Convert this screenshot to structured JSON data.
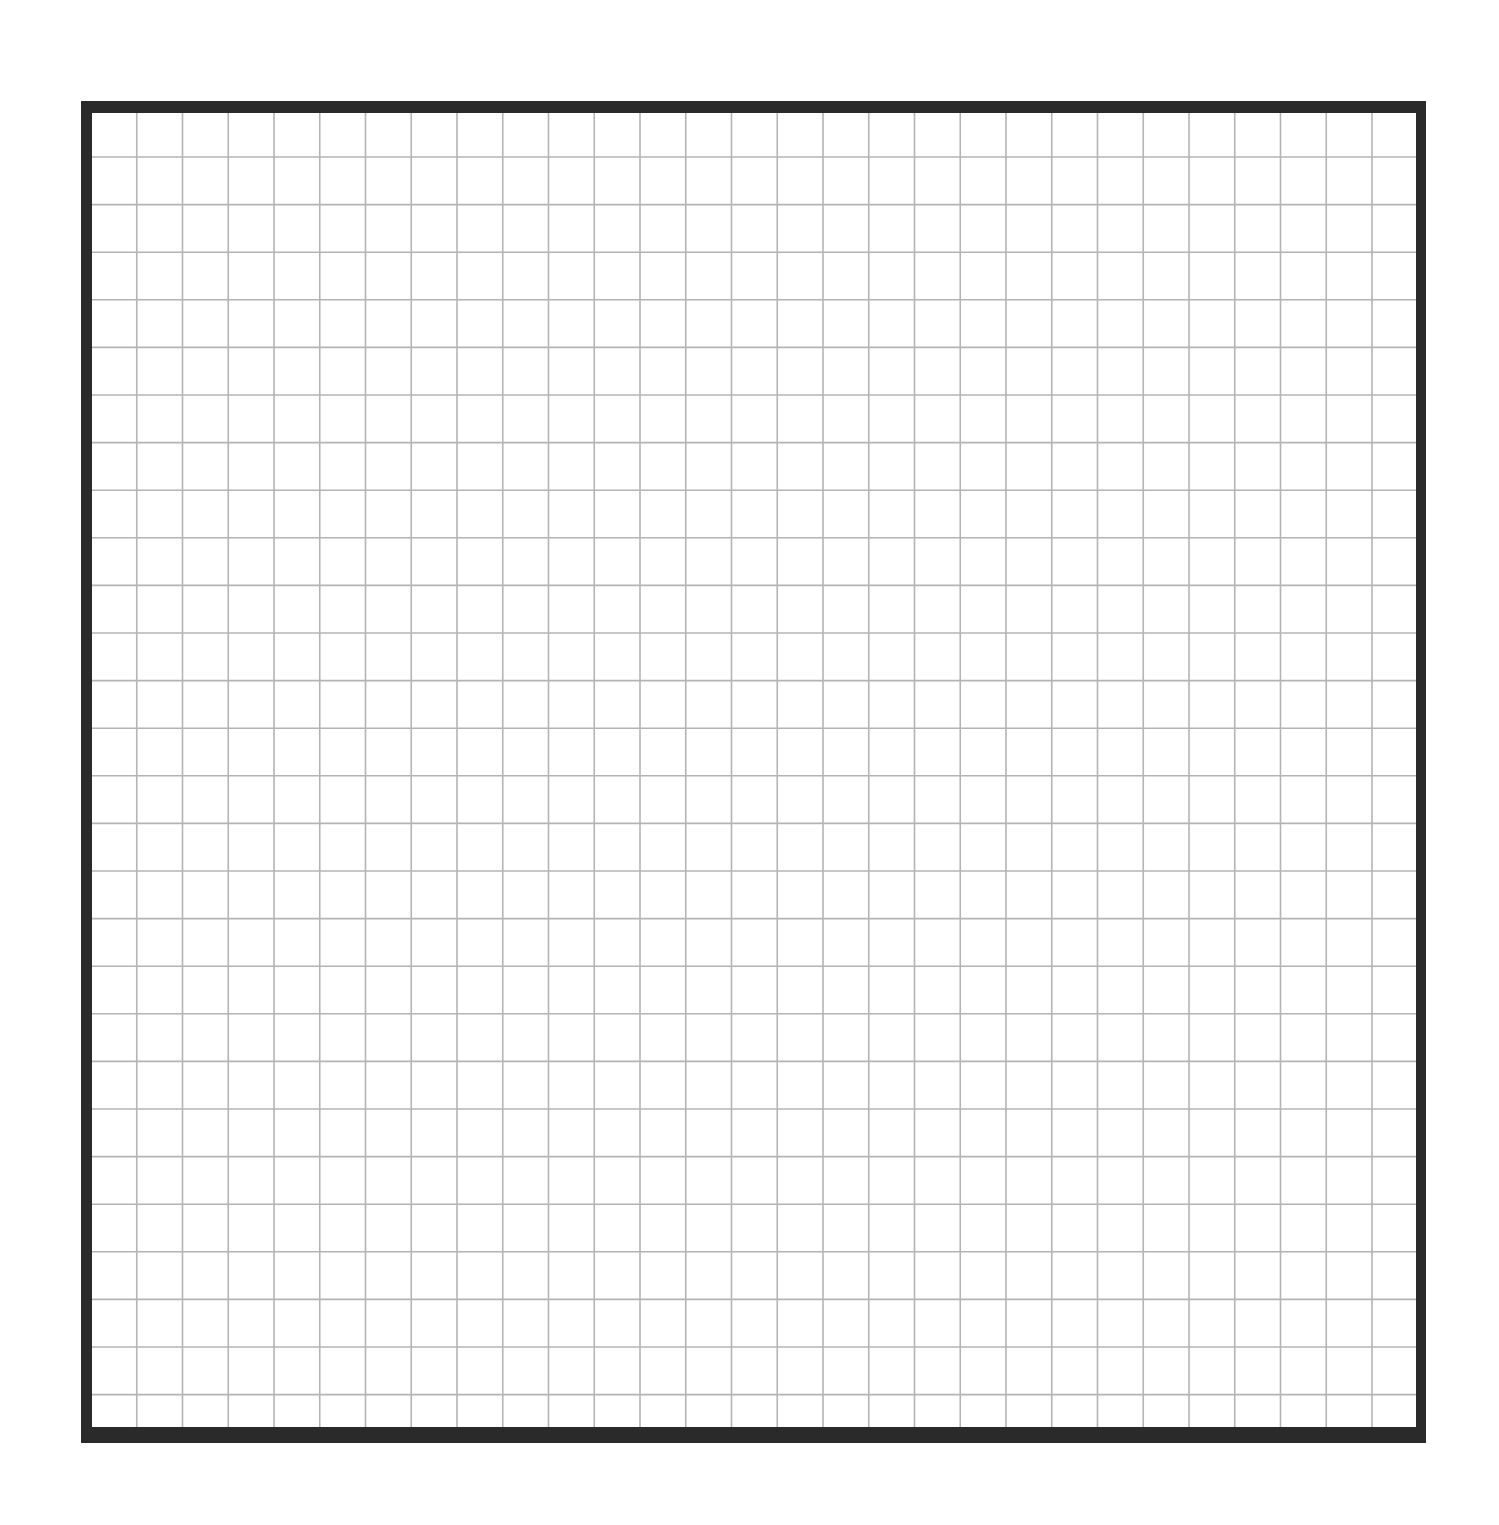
{
  "grid": {
    "frame": {
      "x": 81,
      "y": 101,
      "width": 1345,
      "height": 1342
    },
    "border": {
      "color": "#2a2a2a",
      "left": 11,
      "top": 12,
      "right": 10,
      "bottom": 16
    },
    "lines": {
      "color": "#b4b4b4",
      "width": 1.6,
      "first_x": 91,
      "first_y": 111,
      "spacing_x": 45.75,
      "spacing_y": 47.6,
      "count_x": 29,
      "count_y": 28
    },
    "background": "#ffffff"
  }
}
